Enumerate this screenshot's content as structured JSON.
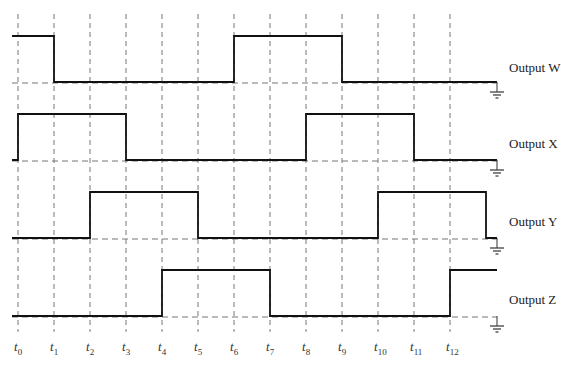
{
  "diagram": {
    "type": "timing-diagram",
    "time_labels": [
      "t0",
      "t1",
      "t2",
      "t3",
      "t4",
      "t5",
      "t6",
      "t7",
      "t8",
      "t9",
      "t10",
      "t11",
      "t12"
    ],
    "time_label_parts": [
      {
        "t": "t",
        "n": "0"
      },
      {
        "t": "t",
        "n": "1"
      },
      {
        "t": "t",
        "n": "2"
      },
      {
        "t": "t",
        "n": "3"
      },
      {
        "t": "t",
        "n": "4"
      },
      {
        "t": "t",
        "n": "5"
      },
      {
        "t": "t",
        "n": "6"
      },
      {
        "t": "t",
        "n": "7"
      },
      {
        "t": "t",
        "n": "8"
      },
      {
        "t": "t",
        "n": "9"
      },
      {
        "t": "t",
        "n": "10"
      },
      {
        "t": "t",
        "n": "11"
      },
      {
        "t": "t",
        "n": "12"
      }
    ],
    "signals": [
      {
        "name": "Output W",
        "levels": [
          1,
          0,
          0,
          0,
          0,
          0,
          1,
          1,
          1,
          0,
          0,
          0,
          0,
          0
        ],
        "initial": 1
      },
      {
        "name": "Output X",
        "levels": [
          1,
          1,
          1,
          0,
          0,
          0,
          0,
          0,
          1,
          1,
          1,
          0,
          0,
          0
        ],
        "initial": 0
      },
      {
        "name": "Output Y",
        "levels": [
          0,
          0,
          1,
          1,
          1,
          0,
          0,
          0,
          0,
          0,
          1,
          1,
          1,
          0
        ],
        "initial": 0
      },
      {
        "name": "Output Z",
        "levels": [
          0,
          0,
          0,
          0,
          1,
          1,
          1,
          0,
          0,
          0,
          0,
          0,
          1,
          1
        ],
        "initial": 0
      }
    ],
    "ground_symbol": "ground-icon",
    "colors": {
      "signal": "#111111",
      "gridline": "#777777",
      "text": "#222222"
    }
  }
}
